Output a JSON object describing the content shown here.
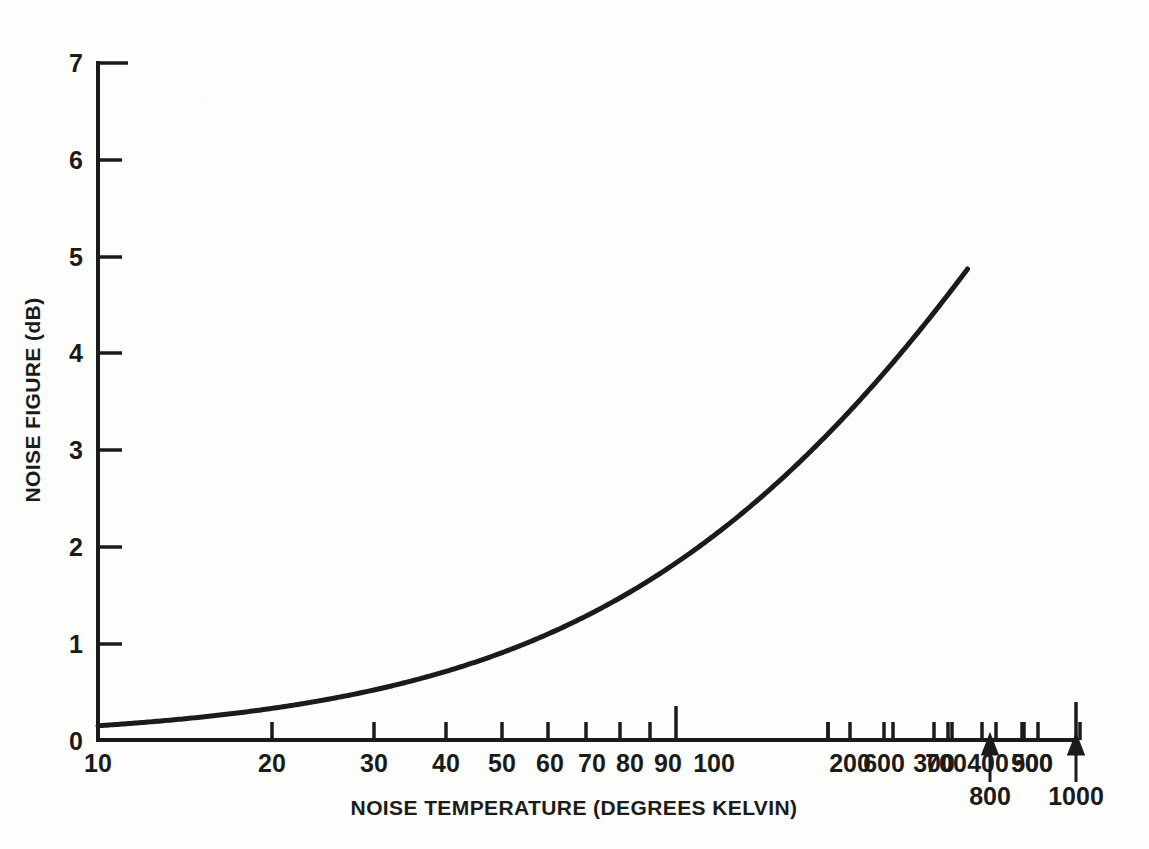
{
  "figure": {
    "background_color": "#fdfdfb",
    "ink_color": "#1b1b1b"
  },
  "chart_data": {
    "type": "line",
    "title": "",
    "xlabel": "NOISE TEMPERATURE (DEGREES KELVIN)",
    "ylabel": "NOISE FIGURE (dB)",
    "xscale": "log",
    "yscale": "linear",
    "xlim": [
      10,
      1000
    ],
    "ylim": [
      0,
      7
    ],
    "grid": false,
    "legend": null,
    "x_tick_labels": [
      "10",
      "20",
      "30",
      "40",
      "50",
      "60",
      "70",
      "80",
      "90",
      "100",
      "200",
      "300",
      "400",
      "500",
      "600",
      "700",
      "800",
      "900",
      "1000"
    ],
    "x_tick_values": [
      10,
      20,
      30,
      40,
      50,
      60,
      70,
      80,
      90,
      100,
      200,
      300,
      400,
      500,
      600,
      700,
      800,
      900,
      1000
    ],
    "x_major_decades": [
      10,
      100,
      1000
    ],
    "x_labels_second_row": [
      "800",
      "1000"
    ],
    "y_tick_labels": [
      "0",
      "1",
      "2",
      "3",
      "4",
      "5",
      "6",
      "7"
    ],
    "y_tick_values": [
      0,
      1,
      2,
      3,
      4,
      5,
      6,
      7
    ],
    "series": [
      {
        "name": "Noise figure vs noise temperature",
        "formula": "NF = 10*log10(1 + T/290)",
        "x": [
          10,
          15,
          20,
          25,
          30,
          40,
          50,
          60,
          70,
          80,
          90,
          100,
          125,
          150,
          175,
          200,
          225,
          250,
          275,
          300,
          350,
          400,
          450,
          500,
          550,
          600
        ],
        "values": [
          0.15,
          0.22,
          0.29,
          0.36,
          0.43,
          0.56,
          0.69,
          0.82,
          0.94,
          1.06,
          1.17,
          1.29,
          1.56,
          1.82,
          2.06,
          2.29,
          2.51,
          2.71,
          2.91,
          3.1,
          3.46,
          3.79,
          4.1,
          4.38,
          4.64,
          4.89
        ],
        "endpoint": [
          600,
          5.0
        ],
        "color": "#1b1b1b",
        "line_width": 4
      }
    ],
    "annotations": [
      {
        "name": "arrow-to-800-tick",
        "label": "800",
        "points_to_value": 800
      },
      {
        "name": "arrow-to-1000-tick",
        "label": "1000",
        "points_to_value": 1000
      }
    ]
  }
}
